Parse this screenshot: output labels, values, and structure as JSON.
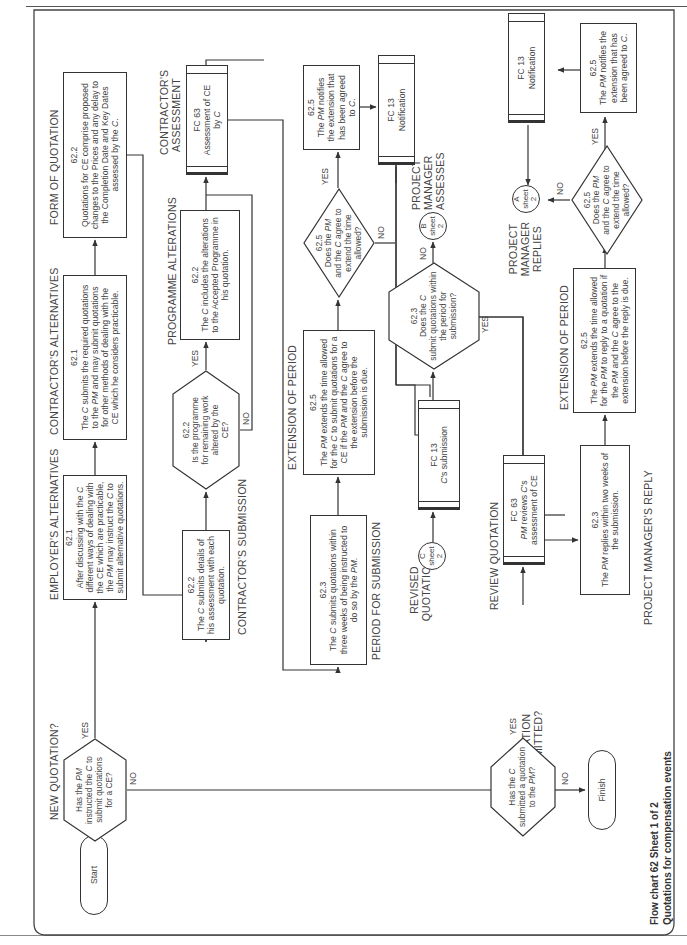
{
  "sections": {
    "new_quotation": "NEW QUOTATION?",
    "employers_alternatives": "EMPLOYER'S ALTERNATIVES",
    "contractors_alternatives": "CONTRACTOR'S ALTERNATIVES",
    "form_of_quotation": "FORM OF QUOTATION",
    "contractors_submission": "CONTRACTOR'S SUBMISSION",
    "programme_alterations": "PROGRAMME ALTERATIONS",
    "contractors_assessment_1": "CONTRACTOR'S",
    "contractors_assessment_2": "ASSESSMENT",
    "period_for_submission": "PERIOD FOR SUBMISSION",
    "extension_of_period_1": "EXTENSION OF PERIOD",
    "project_manager_assesses_1": "PROJECT",
    "project_manager_assesses_2": "MANAGER",
    "project_manager_assesses_3": "ASSESSES",
    "revised_quotation_1": "REVISED",
    "revised_quotation_2": "QUOTATION",
    "review_quotation": "REVIEW QUOTATION",
    "extension_of_period_2": "EXTENSION OF PERIOD",
    "project_manager_replies_1": "PROJECT",
    "project_manager_replies_2": "MANAGER",
    "project_manager_replies_3": "REPLIES",
    "quotation_submitted_1": "QUOTATION",
    "quotation_submitted_2": "SUBMITTED?",
    "project_managers_reply": "PROJECT MANAGER'S REPLY"
  },
  "nodes": {
    "start": "Start",
    "finish": "Finish",
    "d_new_quote": {
      "l1": "Has the ",
      "pm": "PM",
      "l1b": "",
      "l2": "instructed the ",
      "c": "C",
      "l2b": " to",
      "l3": "submit quotations",
      "l4": "for a CE?"
    },
    "employer_box": {
      "ref": "62.1",
      "text_a": "After discussing with the ",
      "c1": "C",
      "text_b": " different ways of dealing with the CE which are practicable, the ",
      "pm": "PM",
      "text_c": " may instruct the ",
      "c2": "C",
      "text_d": " to submit alternative quotations."
    },
    "contractor_alt_box": {
      "ref": "62.1",
      "text_a": "The ",
      "c": "C",
      "text_b": " submits the required quotations to the ",
      "pm": "PM",
      "text_c": " and may submit quotations for other methods of dealing with the CE which he considers practicable."
    },
    "form_box": {
      "ref": "62.2",
      "text": "Quotations for CE comprise proposed changes to the Prices and any delay to the Completion Date and Key Dates assessed by the ",
      "c": "C",
      "end": "."
    },
    "submission_box": {
      "ref": "62.2",
      "text_a": "The ",
      "c": "C",
      "text_b": " submits details of his assessment with each quotation."
    },
    "d_programme": {
      "ref": "62.2",
      "l1": "Is the programme",
      "l2": "for remaining work",
      "l3": "altered by the",
      "l4": "CE?"
    },
    "programme_box": {
      "ref": "62.2",
      "text_a": "The ",
      "c": "C",
      "text_b": " includes the alterations to the Accepted Programme in his quotation."
    },
    "fc63_assessment": {
      "ref": "FC 63",
      "l1": "Assessment of CE",
      "l2": "by ",
      "c": "C"
    },
    "period_box": {
      "ref": "62.3",
      "text_a": "The ",
      "c": "C",
      "text_b": " submits quotations within three weeks of being instructed to do so by the ",
      "pm": "PM",
      "end": "."
    },
    "extension_box_1": {
      "ref": "62.5",
      "text_a": "The ",
      "pm1": "PM",
      "text_b": " extends the time allowed for the ",
      "c1": "C",
      "text_c": " to submit quotations for a CE if the ",
      "pm2": "PM",
      "text_d": " and the ",
      "c2": "C",
      "text_e": " agree to the extension before the submission is due."
    },
    "d_extend_1": {
      "ref": "62.5",
      "l1a": "Does the ",
      "pm": "PM",
      "l2a": "and the ",
      "c": "C",
      "l2b": " agree to",
      "l3": "extend the time",
      "l4": "allowed?"
    },
    "notify_box_1": {
      "ref": "62.5",
      "text_a": "The ",
      "pm": "PM",
      "text_b": " notifies the extension that has been agreed to ",
      "c": "C",
      "end": "."
    },
    "fc13_notification_1": {
      "ref": "FC 13",
      "l1": "Notification"
    },
    "fc13_submission": {
      "ref": "FC 13",
      "c": "C",
      "l1": "'s submission"
    },
    "d_within_period": {
      "ref": "62.3",
      "l1a": "Does the ",
      "c": "C",
      "l2": "submit quotations within",
      "l3": "the period for",
      "l4": "submission?"
    },
    "conn_b": {
      "letter": "B",
      "l1": "sheet",
      "l2": "2"
    },
    "conn_c": {
      "letter": "C",
      "l1": "sheet",
      "l2": "2"
    },
    "conn_a": {
      "letter": "A",
      "l1": "sheet",
      "l2": "2"
    },
    "fc63_review": {
      "ref": "FC 63",
      "pm": "PM",
      "l1": " reviews ",
      "c": "C",
      "l1b": "'s",
      "l2": "assessment of CE"
    },
    "reply_box": {
      "ref": "62.3",
      "text_a": "The ",
      "pm": "PM",
      "text_b": " replies within two weeks of the submission."
    },
    "extension_box_2": {
      "ref": "62.5",
      "text_a": "The ",
      "pm1": "PM",
      "text_b": " extends the time allowed for the ",
      "pm2": "PM",
      "text_c": " to reply to a quotation if the ",
      "pm3": "PM",
      "text_d": " and the ",
      "c": "C",
      "text_e": " agree to the extension before the reply is due."
    },
    "d_extend_2": {
      "ref": "62.5",
      "l1a": "Does the ",
      "pm": "PM",
      "l2a": "and the ",
      "c": "C",
      "l2b": " agree to",
      "l3": "extend the time",
      "l4": "allowed?"
    },
    "notify_box_2": {
      "ref": "62.5",
      "text_a": "The ",
      "pm": "PM",
      "text_b": " notifies the extension that has been agreed to ",
      "c": "C",
      "end": "."
    },
    "fc13_notification_2": {
      "ref": "FC 13",
      "l1": "Notification"
    },
    "d_quote_submitted": {
      "l1a": "Has the ",
      "c": "C",
      "l2": "submitted a quotation",
      "l3a": "to the ",
      "pm": "PM",
      "l3b": "?"
    }
  },
  "edge_labels": {
    "yes": "YES",
    "no": "NO"
  },
  "caption": {
    "line1": "Flow chart 62   Sheet 1 of 2",
    "line2": "Quotations for compensation events"
  }
}
